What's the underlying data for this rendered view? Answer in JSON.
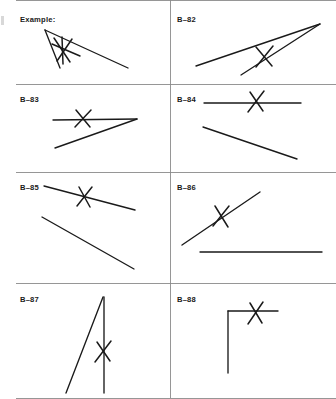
{
  "page": {
    "width": 336,
    "height": 399,
    "background": "#ffffff",
    "ink_color": "#1a1a1a",
    "rule_color": "#8a8a8a"
  },
  "grid": {
    "columns": 2,
    "rows": 4,
    "vertical_divider_x": 170,
    "horizontal_divider_ys": [
      84,
      172,
      283
    ],
    "top_rule_y": 0,
    "bottom_rule_y": 398
  },
  "cells": [
    {
      "id": "example",
      "label": "Example:",
      "label_x": 20,
      "label_y": 16,
      "row": 0,
      "column": 0,
      "mark": {
        "type": "x-mark",
        "cx": 66,
        "cy": 50
      },
      "lines": [
        {
          "name": "long-line",
          "x1": 45,
          "y1": 30,
          "x2": 128,
          "y2": 68
        },
        {
          "name": "short-line",
          "x1": 45,
          "y1": 30,
          "x2": 60,
          "y2": 68
        }
      ],
      "mark_strokes": [
        {
          "x1": 52,
          "y1": 44,
          "x2": 80,
          "y2": 56
        },
        {
          "x1": 57,
          "y1": 61,
          "x2": 72,
          "y2": 39
        },
        {
          "x1": 54,
          "y1": 38,
          "x2": 70,
          "y2": 62
        },
        {
          "x1": 62,
          "y1": 37,
          "x2": 63,
          "y2": 64
        }
      ]
    },
    {
      "id": "b-82",
      "label": "B–82",
      "label_x": 177,
      "label_y": 16,
      "row": 0,
      "column": 1,
      "mark": {
        "type": "x-mark",
        "cx": 265,
        "cy": 56
      },
      "lines": [
        {
          "name": "long-line",
          "x1": 196,
          "y1": 66,
          "x2": 320,
          "y2": 24
        },
        {
          "name": "short-line",
          "x1": 241,
          "y1": 75,
          "x2": 320,
          "y2": 24
        }
      ],
      "mark_strokes": [
        {
          "x1": 256,
          "y1": 47,
          "x2": 272,
          "y2": 66
        },
        {
          "x1": 273,
          "y1": 46,
          "x2": 256,
          "y2": 67
        }
      ]
    },
    {
      "id": "b-83",
      "label": "B–83",
      "label_x": 20,
      "label_y": 96,
      "row": 1,
      "column": 0,
      "mark": {
        "type": "x-mark",
        "cx": 83,
        "cy": 118
      },
      "lines": [
        {
          "name": "horizontal-line",
          "x1": 53,
          "y1": 120,
          "x2": 137,
          "y2": 119
        },
        {
          "name": "diagonal-line",
          "x1": 55,
          "y1": 148,
          "x2": 137,
          "y2": 119
        }
      ],
      "mark_strokes": [
        {
          "x1": 76,
          "y1": 110,
          "x2": 90,
          "y2": 127
        },
        {
          "x1": 91,
          "y1": 110,
          "x2": 75,
          "y2": 127
        }
      ]
    },
    {
      "id": "b-84",
      "label": "B–84",
      "label_x": 177,
      "label_y": 96,
      "row": 1,
      "column": 1,
      "mark": {
        "type": "x-mark",
        "cx": 256,
        "cy": 101
      },
      "lines": [
        {
          "name": "horizontal-line",
          "x1": 204,
          "y1": 103,
          "x2": 301,
          "y2": 103
        },
        {
          "name": "diagonal-line",
          "x1": 203,
          "y1": 127,
          "x2": 297,
          "y2": 159
        }
      ],
      "mark_strokes": [
        {
          "x1": 250,
          "y1": 92,
          "x2": 263,
          "y2": 111
        },
        {
          "x1": 264,
          "y1": 91,
          "x2": 248,
          "y2": 112
        }
      ]
    },
    {
      "id": "b-85",
      "label": "B–85",
      "label_x": 20,
      "label_y": 184,
      "row": 2,
      "column": 0,
      "mark": {
        "type": "x-mark",
        "cx": 85,
        "cy": 196
      },
      "lines": [
        {
          "name": "upper-line",
          "x1": 44,
          "y1": 186,
          "x2": 135,
          "y2": 210
        },
        {
          "name": "lower-line",
          "x1": 42,
          "y1": 217,
          "x2": 134,
          "y2": 269
        }
      ],
      "mark_strokes": [
        {
          "x1": 79,
          "y1": 187,
          "x2": 90,
          "y2": 207
        },
        {
          "x1": 92,
          "y1": 187,
          "x2": 77,
          "y2": 206
        }
      ]
    },
    {
      "id": "b-86",
      "label": "B–86",
      "label_x": 177,
      "label_y": 184,
      "row": 2,
      "column": 1,
      "mark": {
        "type": "x-mark",
        "cx": 222,
        "cy": 216
      },
      "lines": [
        {
          "name": "diagonal-line",
          "x1": 182,
          "y1": 245,
          "x2": 260,
          "y2": 192
        },
        {
          "name": "horizontal-line",
          "x1": 200,
          "y1": 252,
          "x2": 322,
          "y2": 252
        }
      ],
      "mark_strokes": [
        {
          "x1": 215,
          "y1": 206,
          "x2": 228,
          "y2": 227
        },
        {
          "x1": 229,
          "y1": 206,
          "x2": 213,
          "y2": 226
        }
      ]
    },
    {
      "id": "b-87",
      "label": "B–87",
      "label_x": 20,
      "label_y": 296,
      "row": 3,
      "column": 0,
      "mark": {
        "type": "x-mark",
        "cx": 104,
        "cy": 351
      },
      "lines": [
        {
          "name": "vertical-line",
          "x1": 104,
          "y1": 297,
          "x2": 104,
          "y2": 393
        },
        {
          "name": "slanted-line",
          "x1": 103,
          "y1": 297,
          "x2": 66,
          "y2": 393
        }
      ],
      "mark_strokes": [
        {
          "x1": 97,
          "y1": 342,
          "x2": 110,
          "y2": 361
        },
        {
          "x1": 111,
          "y1": 341,
          "x2": 95,
          "y2": 362
        }
      ]
    },
    {
      "id": "b-88",
      "label": "B–88",
      "label_x": 177,
      "label_y": 296,
      "row": 3,
      "column": 1,
      "mark": {
        "type": "x-mark",
        "cx": 256,
        "cy": 313
      },
      "lines": [
        {
          "name": "horizontal-line",
          "x1": 228,
          "y1": 311,
          "x2": 278,
          "y2": 311
        },
        {
          "name": "vertical-line",
          "x1": 228,
          "y1": 311,
          "x2": 228,
          "y2": 373
        }
      ],
      "mark_strokes": [
        {
          "x1": 250,
          "y1": 303,
          "x2": 262,
          "y2": 323
        },
        {
          "x1": 263,
          "y1": 302,
          "x2": 248,
          "y2": 324
        }
      ]
    }
  ]
}
